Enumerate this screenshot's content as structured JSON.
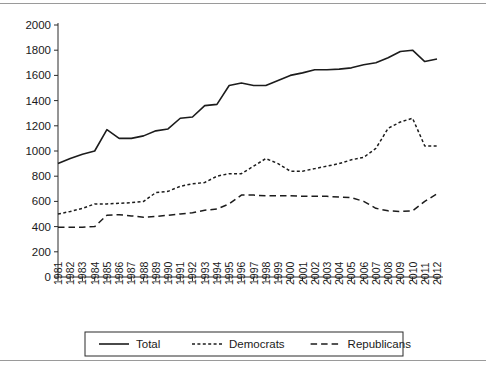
{
  "figure": {
    "background": "#ffffff",
    "border_color": "#9a9a9a",
    "line_color": "#1c1c1c"
  },
  "legend": {
    "position": "bottom-center",
    "entries": [
      {
        "label": "Total",
        "style": "solid"
      },
      {
        "label": "Democrats",
        "style": "dotted"
      },
      {
        "label": "Republicans",
        "style": "dashed"
      }
    ]
  },
  "chart_data": {
    "type": "line",
    "title": "",
    "subtitle": "",
    "xlabel": "",
    "ylabel": "",
    "grid": false,
    "legend_position": "bottom",
    "xlim": [
      1981,
      2012
    ],
    "ylim": [
      0,
      2000
    ],
    "yticks": [
      0,
      200,
      400,
      600,
      800,
      1000,
      1200,
      1400,
      1600,
      1800,
      2000
    ],
    "ytick_labels": [
      "0",
      "200",
      "400",
      "600",
      "800",
      "1000",
      "1200",
      "1400",
      "1600",
      "1800",
      "2000"
    ],
    "x": [
      1981,
      1982,
      1983,
      1984,
      1985,
      1986,
      1987,
      1988,
      1989,
      1990,
      1991,
      1992,
      1993,
      1994,
      1995,
      1996,
      1997,
      1998,
      1999,
      2000,
      2001,
      2002,
      2003,
      2004,
      2005,
      2006,
      2007,
      2008,
      2009,
      2010,
      2011,
      2012
    ],
    "xtick_labels": [
      "1981",
      "1982",
      "1983",
      "1984",
      "1985",
      "1986",
      "1987",
      "1988",
      "1989",
      "1990",
      "1991",
      "1992",
      "1993",
      "1994",
      "1995",
      "1996",
      "1997",
      "1998",
      "1999",
      "2000",
      "2001",
      "2002",
      "2003",
      "2004",
      "2005",
      "2006",
      "2007",
      "2008",
      "2009",
      "2010",
      "2011",
      "2012"
    ],
    "series": [
      {
        "name": "Total",
        "style": "solid",
        "values": [
          900,
          940,
          975,
          1000,
          1170,
          1100,
          1100,
          1120,
          1160,
          1175,
          1260,
          1270,
          1360,
          1370,
          1520,
          1540,
          1520,
          1520,
          1560,
          1600,
          1620,
          1645,
          1645,
          1650,
          1660,
          1685,
          1700,
          1740,
          1790,
          1800,
          1710,
          1730
        ]
      },
      {
        "name": "Democrats",
        "style": "dotted",
        "values": [
          500,
          520,
          545,
          580,
          580,
          585,
          590,
          600,
          670,
          680,
          720,
          740,
          750,
          800,
          820,
          820,
          880,
          940,
          900,
          840,
          840,
          860,
          880,
          900,
          930,
          950,
          1020,
          1180,
          1230,
          1260,
          1040,
          1040
        ]
      },
      {
        "name": "Republicans",
        "style": "dashed",
        "values": [
          395,
          395,
          395,
          400,
          490,
          495,
          485,
          475,
          480,
          490,
          500,
          510,
          530,
          540,
          580,
          650,
          650,
          645,
          645,
          645,
          640,
          640,
          640,
          635,
          630,
          600,
          545,
          525,
          520,
          525,
          600,
          660
        ]
      }
    ]
  }
}
